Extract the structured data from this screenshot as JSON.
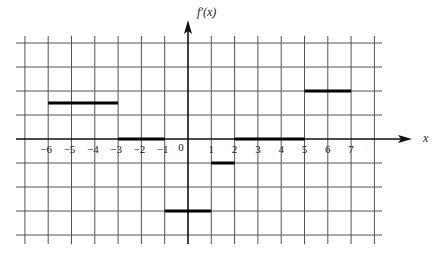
{
  "chart_data": {
    "type": "line",
    "title": "",
    "xlabel": "x",
    "ylabel": "f'(x)",
    "xlim": [
      -7,
      9
    ],
    "ylim": [
      -4,
      4.5
    ],
    "grid": true,
    "x_ticks": [
      "-6",
      "-5",
      "-4",
      "-3",
      "-2",
      "-1",
      "0",
      "1",
      "2",
      "3",
      "4",
      "5",
      "6",
      "7"
    ],
    "series": [
      {
        "name": "f'(x)",
        "style": "piecewise-constant segments",
        "segments": [
          {
            "x_start": -6,
            "x_end": -3,
            "y": 1.5
          },
          {
            "x_start": -3,
            "x_end": -1,
            "y": 0
          },
          {
            "x_start": -1,
            "x_end": 1,
            "y": -3
          },
          {
            "x_start": 1,
            "x_end": 2,
            "y": -1
          },
          {
            "x_start": 2,
            "x_end": 5,
            "y": 0
          },
          {
            "x_start": 5,
            "x_end": 7,
            "y": 2
          }
        ]
      }
    ]
  },
  "axes": {
    "y_label": "f′(x)",
    "x_label": "x"
  }
}
